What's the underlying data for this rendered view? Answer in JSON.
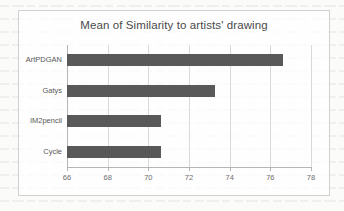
{
  "chart_data": {
    "type": "bar",
    "orientation": "horizontal",
    "title": "Mean of Similarity to artists' drawing",
    "xlabel": "",
    "ylabel": "",
    "categories": [
      "ArtPDGAN",
      "Gatys",
      "IM2pencil",
      "Cycle"
    ],
    "values": [
      76.6,
      73.3,
      70.6,
      70.6
    ],
    "xlim": [
      66,
      78
    ],
    "xticks": [
      66,
      68,
      70,
      72,
      74,
      76,
      78
    ],
    "xtick_labels": [
      "66",
      "68",
      "70",
      "72",
      "74",
      "76",
      "78"
    ],
    "grid": "vertical",
    "legend": "none",
    "series": [
      {
        "name": "Mean of Similarity to artists' drawing",
        "values": [
          76.6,
          73.3,
          70.6,
          70.6
        ]
      }
    ],
    "colors": {
      "bar": "#595959",
      "gridline": "#d9d9d9",
      "axis": "#b6b6b6",
      "title_text": "#4a4a4a",
      "tick_text": "#6d6d6d",
      "plot_background": "#ffffff",
      "page_background": "#fbfbfa",
      "frame_border": "#d0d0d0"
    }
  }
}
